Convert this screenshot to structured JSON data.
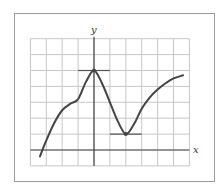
{
  "figure": {
    "type": "function-graph",
    "axes": {
      "x_label": "x",
      "y_label": "y"
    },
    "grid": {
      "x_min": -4,
      "x_max": 6,
      "y_min": -1,
      "y_max": 7,
      "step": 1
    },
    "colors": {
      "frame": "#9a9a9a",
      "grid": "#c8c8c8",
      "axis": "#444444",
      "curve": "#444444",
      "tangent": "#555555"
    }
  },
  "chart_data": {
    "type": "line",
    "title": "",
    "xlabel": "x",
    "ylabel": "y",
    "xlim": [
      -4,
      6
    ],
    "ylim": [
      -1,
      7
    ],
    "grid": true,
    "series": [
      {
        "name": "f(x)",
        "x": [
          -3.4,
          -3.0,
          -2.5,
          -2.0,
          -1.5,
          -1.0,
          -0.5,
          0.0,
          0.5,
          1.0,
          1.5,
          2.0,
          2.5,
          3.0,
          3.5,
          4.0,
          4.5,
          5.0,
          5.6
        ],
        "y": [
          -0.4,
          0.6,
          1.7,
          2.5,
          2.9,
          3.2,
          4.3,
          5.0,
          4.2,
          3.0,
          1.8,
          1.0,
          1.6,
          2.6,
          3.3,
          3.8,
          4.2,
          4.5,
          4.7
        ]
      }
    ],
    "annotations": [
      {
        "type": "horizontal-tangent",
        "label": "local maximum",
        "x": 0,
        "y": 5,
        "x_range": [
          -1,
          1
        ]
      },
      {
        "type": "horizontal-tangent",
        "label": "local minimum",
        "x": 2,
        "y": 1,
        "x_range": [
          1,
          3
        ]
      }
    ]
  }
}
